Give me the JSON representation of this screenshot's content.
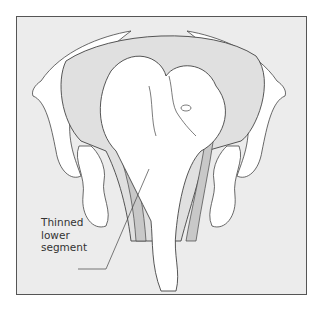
{
  "figure": {
    "type": "anatomical illustration",
    "labels": [
      {
        "id": "thinned_lower_segment",
        "lines": [
          "Thinned",
          "lower",
          "segment"
        ]
      }
    ],
    "colors": {
      "background": "#ececec",
      "frame_border": "#555555",
      "outline": "#444444",
      "fill_body": "#ffffff",
      "fill_shaded": "#c8c8c8"
    }
  }
}
